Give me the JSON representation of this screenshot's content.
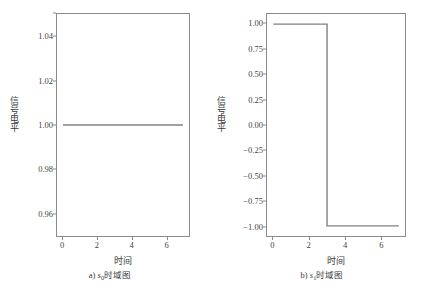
{
  "figure": {
    "background_color": "#ffffff",
    "line_color": "#808080",
    "frame_color": "#8a8a8a"
  },
  "panel_a": {
    "xlabel": "时间",
    "ylabel": "信号电平",
    "caption_prefix": "a) ",
    "caption_symbol": "s",
    "caption_subscript": "0",
    "caption_suffix": "时域图",
    "yticks": [
      "1.04",
      "1.02",
      "1.00",
      "0.98",
      "0.96"
    ],
    "xticks": [
      "0",
      "2",
      "4",
      "6"
    ]
  },
  "panel_b": {
    "xlabel": "时间",
    "ylabel": "信号电平",
    "caption_prefix": "b) ",
    "caption_symbol": "s",
    "caption_subscript": "1",
    "caption_suffix": "时域图",
    "yticks": [
      "1.00",
      "0.75",
      "0.50",
      "0.25",
      "0.00",
      "−0.25",
      "−0.50",
      "−0.75",
      "−1.00"
    ],
    "xticks": [
      "0",
      "2",
      "4",
      "6"
    ]
  },
  "chart_data": [
    {
      "type": "line",
      "panel": "a",
      "title": "a) s0时域图",
      "xlabel": "时间",
      "ylabel": "信号电平",
      "xlim": [
        -0.35,
        7.35
      ],
      "ylim": [
        0.9495,
        1.0505
      ],
      "xticks": [
        0,
        2,
        4,
        6
      ],
      "yticks": [
        1.04,
        1.02,
        1.0,
        0.98,
        0.96
      ],
      "grid": false,
      "legend": null,
      "series": [
        {
          "name": "s0",
          "x": [
            0,
            7
          ],
          "values": [
            1.0,
            1.0
          ],
          "color": "#808080"
        }
      ]
    },
    {
      "type": "line",
      "panel": "b",
      "title": "b) s1时域图",
      "xlabel": "时间",
      "ylabel": "信号电平",
      "xlim": [
        -0.35,
        7.35
      ],
      "ylim": [
        -1.1,
        1.1
      ],
      "xticks": [
        0,
        2,
        4,
        6
      ],
      "yticks": [
        1.0,
        0.75,
        0.5,
        0.25,
        0.0,
        -0.25,
        -0.5,
        -0.75,
        -1.0
      ],
      "grid": false,
      "legend": null,
      "series": [
        {
          "name": "s1",
          "x": [
            0,
            3,
            3,
            7
          ],
          "values": [
            1.0,
            1.0,
            -1.0,
            -1.0
          ],
          "color": "#808080"
        }
      ]
    }
  ]
}
